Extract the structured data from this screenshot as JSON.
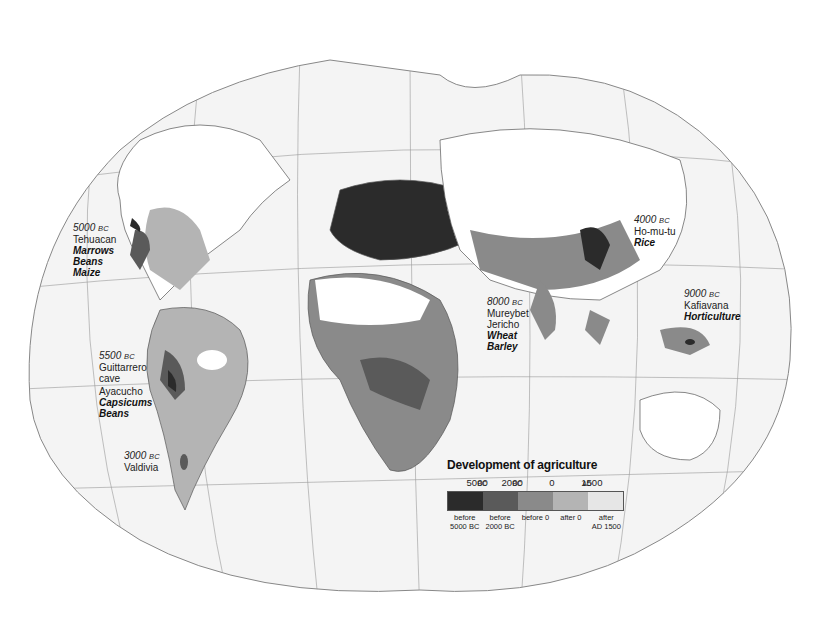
{
  "map": {
    "title": "Development of agriculture",
    "projection": "world-ellipse-graticule",
    "ocean_color": "#f4f4f4",
    "land_base_color": "#ffffff"
  },
  "sites": [
    {
      "id": "tehuacan",
      "date": "5000",
      "era": "BC",
      "place": "Tehuacan",
      "crops": [
        "Marrows",
        "Beans",
        "Maize"
      ]
    },
    {
      "id": "guittarrero",
      "date": "5500",
      "era": "BC",
      "place_lines": [
        "Guittarrero",
        "cave"
      ]
    },
    {
      "id": "ayacucho",
      "place": "Ayacucho",
      "crops": [
        "Capsicums",
        "Beans"
      ]
    },
    {
      "id": "valdivia",
      "date": "3000",
      "era": "BC",
      "place": "Valdivia"
    },
    {
      "id": "mureybet",
      "date": "8000",
      "era": "BC",
      "place_lines": [
        "Mureybet",
        "Jericho"
      ],
      "crops": [
        "Wheat",
        "Barley"
      ]
    },
    {
      "id": "homutu",
      "date": "4000",
      "era": "BC",
      "place": "Ho-mu-tu",
      "crops": [
        "Rice"
      ]
    },
    {
      "id": "kafiavana",
      "date": "9000",
      "era": "BC",
      "place": "Kafiavana",
      "crops": [
        "Horticulture"
      ]
    }
  ],
  "legend": {
    "title": "Development of agriculture",
    "ticks": [
      {
        "value": "5000",
        "era": "BC"
      },
      {
        "value": "2000",
        "era": "BC"
      },
      {
        "value": "0",
        "era": ""
      },
      {
        "value": "1500",
        "era": "AD",
        "prefix": true
      }
    ],
    "categories": [
      {
        "label1": "before",
        "label2": "5000 BC",
        "color": "#2b2b2b"
      },
      {
        "label1": "before",
        "label2": "2000 BC",
        "color": "#5a5a5a"
      },
      {
        "label1": "before 0",
        "label2": "",
        "color": "#8a8a8a"
      },
      {
        "label1": "after 0",
        "label2": "",
        "color": "#b4b4b4"
      },
      {
        "label1": "after",
        "label2": "AD 1500",
        "color": "#e6e6e6"
      }
    ]
  }
}
